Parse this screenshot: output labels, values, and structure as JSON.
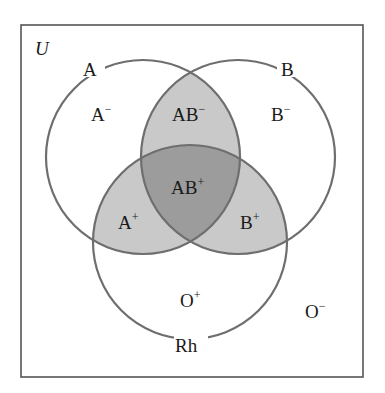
{
  "diagram": {
    "universe_label": "U",
    "sets": [
      {
        "id": "A",
        "label": "A"
      },
      {
        "id": "B",
        "label": "B"
      },
      {
        "id": "Rh",
        "label": "Rh"
      }
    ],
    "regions": [
      {
        "id": "A-neg",
        "base": "A",
        "sign": "−"
      },
      {
        "id": "B-neg",
        "base": "B",
        "sign": "−"
      },
      {
        "id": "AB-neg",
        "base": "AB",
        "sign": "−"
      },
      {
        "id": "AB-pos",
        "base": "AB",
        "sign": "+"
      },
      {
        "id": "A-pos",
        "base": "A",
        "sign": "+"
      },
      {
        "id": "B-pos",
        "base": "B",
        "sign": "+"
      },
      {
        "id": "O-pos",
        "base": "O",
        "sign": "+"
      },
      {
        "id": "O-neg",
        "base": "O",
        "sign": "−"
      }
    ],
    "colors": {
      "stroke": "#6e6e6e",
      "frame": "#555555",
      "pair_overlap_fill": "#c9c9c9",
      "triple_overlap_fill": "#9c9c9c",
      "background": "#ffffff",
      "text": "#1a1a1a"
    }
  }
}
